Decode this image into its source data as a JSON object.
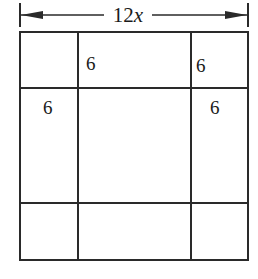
{
  "diagram": {
    "dimension": {
      "label": "12x",
      "label_number": "12",
      "label_variable": "x",
      "arrows": "double-headed"
    },
    "grid": {
      "rows": 3,
      "cols": 3,
      "outer_width_label": "12x"
    },
    "cell_labels": [
      {
        "id": "top-middle-left",
        "text": "6"
      },
      {
        "id": "top-right-left",
        "text": "6"
      },
      {
        "id": "left-middle-top",
        "text": "6"
      },
      {
        "id": "right-middle-top",
        "text": "6"
      }
    ],
    "colors": {
      "line": "#2a2a2a",
      "background": "#ffffff"
    }
  }
}
